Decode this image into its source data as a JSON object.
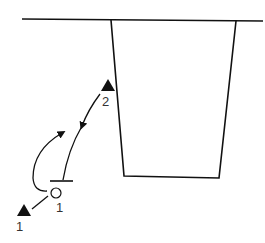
{
  "diagram": {
    "type": "play-diagram",
    "colors": {
      "stroke": "#111111",
      "background": "#ffffff",
      "label": "#333333"
    },
    "players": [
      {
        "id": "triangle-1",
        "shape": "filled-triangle",
        "label": "1"
      },
      {
        "id": "triangle-2",
        "shape": "filled-triangle",
        "label": "2"
      },
      {
        "id": "circle-1",
        "shape": "open-circle",
        "label": "1"
      }
    ],
    "elements": {
      "baseline": "top boundary line",
      "area": "trapezoid zone",
      "screen": "T-bar"
    }
  }
}
